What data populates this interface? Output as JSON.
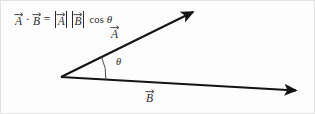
{
  "figure": {
    "name": "dot-product-geometric-definition",
    "background_color": "#fdfdfd",
    "border_color": "#e3e3e3",
    "stroke_color": "#141414",
    "text_color": "#2b2b2b",
    "width": 315,
    "height": 114
  },
  "equation": {
    "full_text": "A⃗ · B⃗ = |A⃗| |B⃗| cos θ",
    "lhs_vector_1": "A",
    "dot_operator": "·",
    "lhs_vector_2": "B",
    "equals": "=",
    "magnitude_vector_1": "A",
    "magnitude_vector_2": "B",
    "trig_function": "cos",
    "angle_symbol": "θ"
  },
  "labels": {
    "vector_a": "A",
    "vector_b": "B",
    "angle": "θ"
  },
  "geometry": {
    "origin": {
      "x": 60,
      "y": 76
    },
    "vector_a_tip": {
      "x": 198,
      "y": 7
    },
    "vector_b_tip": {
      "x": 303,
      "y": 90
    },
    "angle_arc_radius": 45,
    "stroke_width": 2
  }
}
